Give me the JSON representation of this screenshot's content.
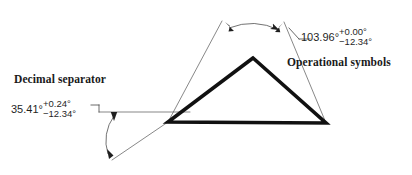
{
  "figure": {
    "background_color": "#ffffff",
    "line_color": "#1f1f1f",
    "thick_line_color": "#111111"
  },
  "annotations": {
    "decimal_separator_label": "Decimal separator",
    "operational_symbols_label": "Operational symbols"
  },
  "dimensions": [
    {
      "id": "lower-left-angle",
      "nominal": "35.41°",
      "upper_tolerance": "+0.24°",
      "lower_tolerance": "−12.34°"
    },
    {
      "id": "upper-apex-angle",
      "nominal": "103.96°",
      "upper_tolerance": "+0.00°",
      "lower_tolerance": "−12.34°"
    }
  ],
  "geometry": {
    "triangle": {
      "apex": [
        253,
        58
      ],
      "left_vertex": [
        168,
        122
      ],
      "right_vertex": [
        326,
        123
      ]
    }
  }
}
